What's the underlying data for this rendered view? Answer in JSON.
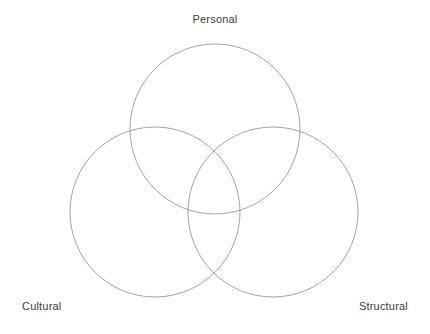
{
  "canvas": {
    "width": 430,
    "height": 334,
    "background_color": "#ffffff"
  },
  "diagram": {
    "type": "venn-3-circle",
    "stroke_color": "#8a8a8a",
    "stroke_width": 0.8,
    "fill": "none",
    "label_color": "#3c3c3c",
    "circles": [
      {
        "id": "personal",
        "label": "Personal",
        "cx": 215,
        "cy": 129,
        "r": 85,
        "label_position": "top-center"
      },
      {
        "id": "cultural",
        "label": "Cultural",
        "cx": 155,
        "cy": 212,
        "r": 85,
        "label_position": "bottom-left"
      },
      {
        "id": "structural",
        "label": "Structural",
        "cx": 273,
        "cy": 212,
        "r": 85,
        "label_position": "bottom-right"
      }
    ]
  },
  "labels": {
    "personal": "Personal",
    "cultural": "Cultural",
    "structural": "Structural"
  }
}
